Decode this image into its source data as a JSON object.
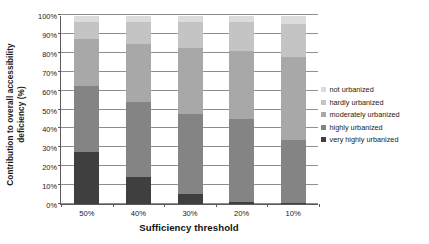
{
  "chart_data": {
    "type": "bar",
    "stacked": true,
    "stack_mode": "percent",
    "title": "",
    "xlabel": "Sufficiency threshold",
    "ylabel": "Contribution to overall accessibility deficiency (%)",
    "ylabel_lines": [
      "Contribution to overall accessibility",
      "deficiency (%)"
    ],
    "categories": [
      "50%",
      "40%",
      "30%",
      "20%",
      "10%"
    ],
    "ylim": [
      0,
      100
    ],
    "yticks": [
      "0%",
      "10%",
      "20%",
      "30%",
      "40%",
      "50%",
      "60%",
      "70%",
      "80%",
      "90%",
      "100%"
    ],
    "ytick_values": [
      0,
      10,
      20,
      30,
      40,
      50,
      60,
      70,
      80,
      90,
      100
    ],
    "grid": true,
    "grid_axis": "y",
    "legend_position": "right",
    "series": [
      {
        "name": "very highly urbanized",
        "color": "#3f3f3f",
        "values": [
          27.5,
          14.5,
          5.5,
          1.0,
          0.5
        ]
      },
      {
        "name": "highly urbanized",
        "color": "#848484",
        "values": [
          35.0,
          39.5,
          42.5,
          44.0,
          33.5
        ]
      },
      {
        "name": "moderately urbanized",
        "color": "#a8a8a8",
        "values": [
          25.5,
          31.0,
          35.0,
          36.5,
          44.0
        ]
      },
      {
        "name": "hardly urbanized",
        "color": "#c4c4c4",
        "values": [
          9.0,
          12.0,
          14.0,
          15.5,
          18.0
        ]
      },
      {
        "name": "not urbanized",
        "color": "#dcdcdc",
        "values": [
          3.0,
          3.0,
          3.0,
          3.0,
          4.0
        ]
      }
    ],
    "legend_order_top_down": [
      "not urbanized",
      "hardly urbanized",
      "moderately urbanized",
      "highly urbanized",
      "very highly urbanized"
    ],
    "cumulative_tops": {
      "50%": [
        27.5,
        62.5,
        88.0,
        97.0,
        100.0
      ],
      "40%": [
        14.5,
        54.0,
        85.0,
        97.0,
        100.0
      ],
      "30%": [
        5.5,
        48.0,
        83.0,
        97.0,
        100.0
      ],
      "20%": [
        1.0,
        45.0,
        81.5,
        97.0,
        100.0
      ],
      "10%": [
        0.5,
        34.0,
        78.0,
        96.0,
        100.0
      ]
    }
  },
  "legend": {
    "items": [
      {
        "label": "not urbanized",
        "color": "#dcdcdc"
      },
      {
        "label": "hardly urbanized",
        "color": "#c4c4c4"
      },
      {
        "label": "moderately urbanized",
        "color": "#a8a8a8"
      },
      {
        "label": "highly urbanized",
        "color": "#848484"
      },
      {
        "label": "very highly urbanized",
        "color": "#3f3f3f"
      }
    ]
  },
  "axes": {
    "x_title": "Sufficiency threshold",
    "y_title_line1": "Contribution to overall accessibility",
    "y_title_line2": "deficiency (%)"
  },
  "colors": {
    "axis": "#5a5a5a",
    "grid": "#8d8d8d",
    "text": "#1a1a1a",
    "background": "#ffffff"
  }
}
